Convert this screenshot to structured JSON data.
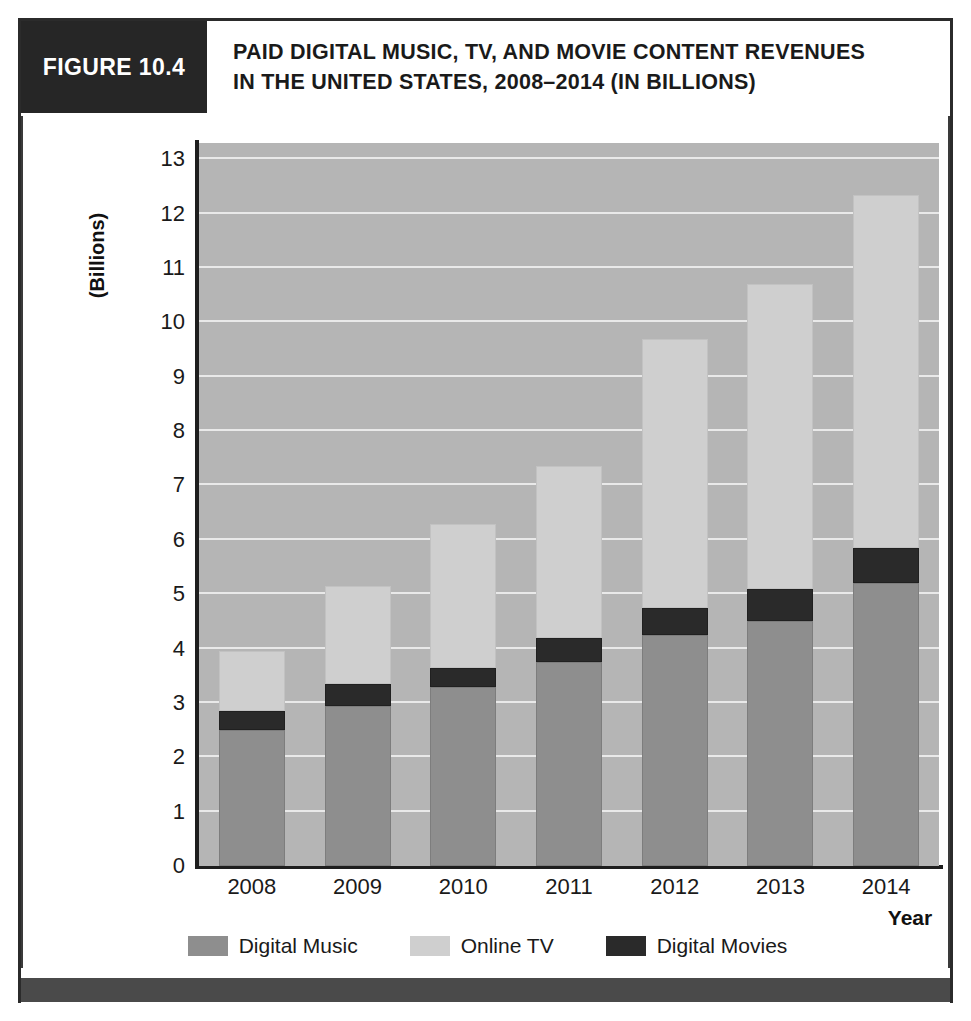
{
  "figure": {
    "number_label": "FIGURE 10.4",
    "title_line1": "PAID DIGITAL MUSIC, TV, AND MOVIE CONTENT REVENUES",
    "title_line2": "IN THE UNITED STATES, 2008–2014 (IN BILLIONS)"
  },
  "colors": {
    "header_block": "#262626",
    "plot_background": "#b5b5b5",
    "gridline": "#e9e9e9",
    "digital_music": "#8e8e8e",
    "online_tv": "#cfcfcf",
    "digital_movies": "#2a2a2a",
    "axis": "#1e1e1e",
    "footer_bar": "#4a4a4a"
  },
  "chart_data": {
    "type": "bar",
    "stacked": true,
    "title": "PAID DIGITAL MUSIC, TV, AND MOVIE CONTENT REVENUES IN THE UNITED STATES, 2008–2014 (IN BILLIONS)",
    "xlabel": "Year",
    "ylabel": "(Billions)",
    "categories": [
      "2008",
      "2009",
      "2010",
      "2011",
      "2012",
      "2013",
      "2014"
    ],
    "ylim": [
      0,
      13.3
    ],
    "yticks": [
      0,
      1,
      2,
      3,
      4,
      5,
      6,
      7,
      8,
      9,
      10,
      11,
      12,
      13
    ],
    "ytick_labels": [
      "0",
      "1",
      "2",
      "3",
      "4",
      "5",
      "6",
      "7",
      "8",
      "9",
      "10",
      "11",
      "12",
      "13"
    ],
    "grid": true,
    "legend_position": "bottom",
    "stack_order": [
      "Digital Music",
      "Digital Movies",
      "Online TV"
    ],
    "series": [
      {
        "name": "Digital Music",
        "color": "#8e8e8e",
        "values": [
          2.5,
          2.95,
          3.3,
          3.75,
          4.25,
          4.5,
          5.2
        ]
      },
      {
        "name": "Digital Movies",
        "color": "#2a2a2a",
        "values": [
          0.35,
          0.4,
          0.35,
          0.45,
          0.5,
          0.6,
          0.65
        ]
      },
      {
        "name": "Online TV",
        "color": "#cfcfcf",
        "values": [
          1.1,
          1.8,
          2.65,
          3.15,
          4.95,
          5.6,
          6.5
        ]
      }
    ],
    "totals": [
      3.95,
      5.15,
      6.3,
      7.35,
      9.7,
      10.7,
      12.35
    ]
  },
  "legend": {
    "items": [
      {
        "label": "Digital Music"
      },
      {
        "label": "Online TV"
      },
      {
        "label": "Digital Movies"
      }
    ]
  }
}
